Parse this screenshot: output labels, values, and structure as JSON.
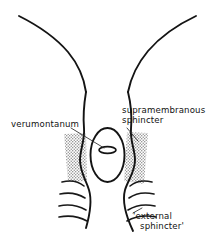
{
  "figure": {
    "background_color": "#ffffff",
    "line_color": "#141414",
    "shading_color": "#a8a8a8",
    "width": 216,
    "height": 245
  },
  "labels": {
    "verumontanum": "verumontanum",
    "supramembranous_line1": "supramembranous",
    "supramembranous_line2": "sphincter",
    "external_line1": "'external",
    "external_line2": "sphincter'"
  },
  "structures": [
    {
      "name": "bladder-neck-funnel",
      "description": "Two symmetric curved walls forming funnel at top"
    },
    {
      "name": "prostatic-urethra-cavity",
      "description": "Central elongated oval lumen"
    },
    {
      "name": "verumontanum-nodule",
      "description": "Small oval within the lumen"
    },
    {
      "name": "supramembranous-sphincter-shading",
      "description": "Stippled blocks flanking the urethra on both sides"
    },
    {
      "name": "external-sphincter-fibers",
      "description": "Four curved striated muscle fibre lines on each side"
    }
  ]
}
